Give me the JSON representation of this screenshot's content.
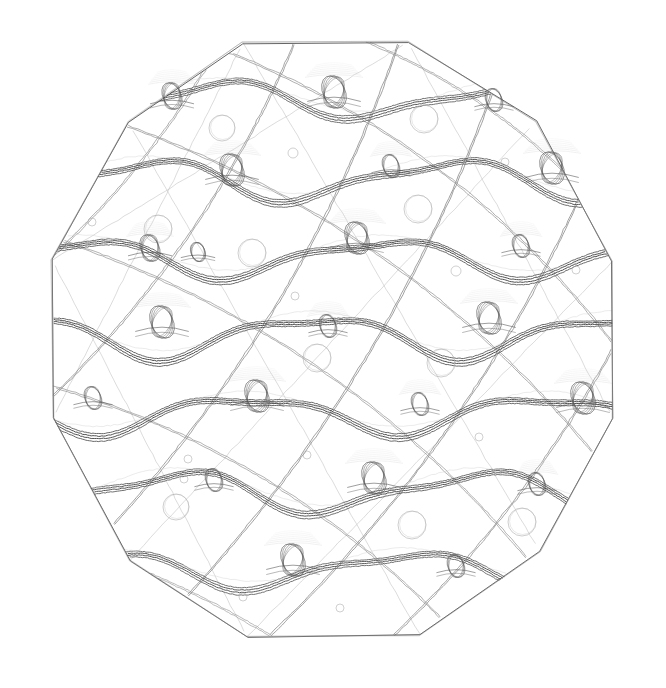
{
  "canvas": {
    "width": 666,
    "height": 688,
    "background_color": "#ffffff",
    "title": "Generative line-art plate: polygonal disc with sinusoidal bands, diagonal sweeps, loop knots and small circles"
  },
  "palette": {
    "ink_dark": "#4a4a4a",
    "ink_mid": "#6b6b6b",
    "ink_light": "#9a9a9a",
    "ink_faint": "#bdbdbd",
    "ink_ghost": "#d4d4d4",
    "background": "#ffffff"
  },
  "stroke": {
    "hairline": 0.6,
    "thin": 0.75,
    "normal": 0.9,
    "band": 1.0
  },
  "boundary": {
    "name": "polygonal-disc-outline",
    "sides": 14,
    "center_x": 333,
    "center_y": 340,
    "radius_x": 292,
    "radius_y": 300,
    "rotation_deg": 12.857,
    "vertices": [
      [
        243,
        43
      ],
      [
        408,
        42
      ],
      [
        536,
        121
      ],
      [
        612,
        262
      ],
      [
        613,
        418
      ],
      [
        540,
        552
      ],
      [
        420,
        635
      ],
      [
        247,
        637
      ],
      [
        130,
        560
      ],
      [
        53,
        418
      ],
      [
        52,
        260
      ],
      [
        128,
        122
      ]
    ],
    "note": "Near-regular many-sided polygon approximating a circle; vertical left and right edges"
  },
  "bands": {
    "name": "sinusoidal-wave-bands",
    "count": 7,
    "strokes_per_band": 4,
    "stroke_offsets": [
      -3.2,
      -1.1,
      1.1,
      3.4
    ],
    "wavelength": 300,
    "list": [
      {
        "index": 0,
        "center_y": 100,
        "amplitude": 16,
        "phase_deg": 10,
        "color": "#5a5a5a"
      },
      {
        "index": 1,
        "center_y": 180,
        "amplitude": 18,
        "phase_deg": 95,
        "color": "#555555"
      },
      {
        "index": 2,
        "center_y": 258,
        "amplitude": 17,
        "phase_deg": 175,
        "color": "#505050"
      },
      {
        "index": 3,
        "center_y": 336,
        "amplitude": 19,
        "phase_deg": 255,
        "color": "#4d4d4d"
      },
      {
        "index": 4,
        "center_y": 414,
        "amplitude": 17,
        "phase_deg": 335,
        "color": "#505050"
      },
      {
        "index": 5,
        "center_y": 492,
        "amplitude": 18,
        "phase_deg": 60,
        "color": "#555555"
      },
      {
        "index": 6,
        "center_y": 570,
        "amplitude": 16,
        "phase_deg": 145,
        "color": "#5a5a5a"
      }
    ]
  },
  "diagonals": {
    "name": "diagonal-sweep-curves",
    "count": 14,
    "direction": "lower-left to upper-right and crossing",
    "curvature": 0.22,
    "color": "#7a7a7a",
    "list": [
      {
        "x1": -30,
        "y1": 470,
        "x2": 300,
        "y2": 30,
        "bow": 70,
        "color": "#7c7c7c"
      },
      {
        "x1": 40,
        "y1": 600,
        "x2": 400,
        "y2": 40,
        "bow": 80,
        "color": "#767676"
      },
      {
        "x1": 120,
        "y1": 665,
        "x2": 500,
        "y2": 70,
        "bow": 85,
        "color": "#727272"
      },
      {
        "x1": 210,
        "y1": 690,
        "x2": 600,
        "y2": 150,
        "bow": 80,
        "color": "#767676"
      },
      {
        "x1": 320,
        "y1": 700,
        "x2": 660,
        "y2": 250,
        "bow": 70,
        "color": "#7c7c7c"
      },
      {
        "x1": 430,
        "y1": 700,
        "x2": 690,
        "y2": 360,
        "bow": 55,
        "color": "#858585"
      },
      {
        "x1": -40,
        "y1": 330,
        "x2": 230,
        "y2": 25,
        "bow": 50,
        "color": "#888888"
      },
      {
        "x1": 60,
        "y1": 240,
        "x2": 560,
        "y2": 600,
        "bow": -95,
        "color": "#8e8e8e"
      },
      {
        "x1": 30,
        "y1": 380,
        "x2": 480,
        "y2": 660,
        "bow": -80,
        "color": "#8e8e8e"
      },
      {
        "x1": 110,
        "y1": 120,
        "x2": 630,
        "y2": 500,
        "bow": -100,
        "color": "#8a8a8a"
      },
      {
        "x1": 210,
        "y1": 45,
        "x2": 650,
        "y2": 395,
        "bow": -90,
        "color": "#8a8a8a"
      },
      {
        "x1": 350,
        "y1": 35,
        "x2": 665,
        "y2": 300,
        "bow": -70,
        "color": "#909090"
      },
      {
        "x1": -20,
        "y1": 520,
        "x2": 350,
        "y2": 690,
        "bow": -45,
        "color": "#9a9a9a"
      },
      {
        "x1": 470,
        "y1": 55,
        "x2": 680,
        "y2": 210,
        "bow": -40,
        "color": "#9a9a9a"
      }
    ]
  },
  "knots": {
    "name": "loop-knot-ornaments",
    "count": 26,
    "description": "Small vertically-elongated interlaced loops sitting on wave band crests with fine whisker arcs",
    "list": [
      {
        "cx": 172,
        "cy": 96,
        "rx": 9,
        "ry": 14,
        "size": "medium",
        "whiskers": true
      },
      {
        "cx": 334,
        "cy": 92,
        "rx": 11,
        "ry": 17,
        "size": "large",
        "whiskers": true
      },
      {
        "cx": 494,
        "cy": 100,
        "rx": 8,
        "ry": 12,
        "size": "small",
        "whiskers": false
      },
      {
        "cx": 232,
        "cy": 170,
        "rx": 11,
        "ry": 17,
        "size": "large",
        "whiskers": true
      },
      {
        "cx": 391,
        "cy": 166,
        "rx": 8,
        "ry": 12,
        "size": "small",
        "whiskers": true
      },
      {
        "cx": 552,
        "cy": 168,
        "rx": 11,
        "ry": 17,
        "size": "large",
        "whiskers": true
      },
      {
        "cx": 150,
        "cy": 248,
        "rx": 9,
        "ry": 14,
        "size": "medium",
        "whiskers": true
      },
      {
        "cx": 198,
        "cy": 252,
        "rx": 7,
        "ry": 10,
        "size": "small",
        "whiskers": false
      },
      {
        "cx": 357,
        "cy": 238,
        "rx": 11,
        "ry": 17,
        "size": "large",
        "whiskers": true
      },
      {
        "cx": 521,
        "cy": 246,
        "rx": 8,
        "ry": 12,
        "size": "small",
        "whiskers": true
      },
      {
        "cx": 162,
        "cy": 322,
        "rx": 11,
        "ry": 17,
        "size": "large",
        "whiskers": true
      },
      {
        "cx": 328,
        "cy": 326,
        "rx": 8,
        "ry": 12,
        "size": "small",
        "whiskers": true
      },
      {
        "cx": 489,
        "cy": 318,
        "rx": 11,
        "ry": 17,
        "size": "large",
        "whiskers": true
      },
      {
        "cx": 93,
        "cy": 398,
        "rx": 8,
        "ry": 12,
        "size": "small",
        "whiskers": false
      },
      {
        "cx": 257,
        "cy": 396,
        "rx": 11,
        "ry": 17,
        "size": "large",
        "whiskers": true
      },
      {
        "cx": 420,
        "cy": 404,
        "rx": 8,
        "ry": 12,
        "size": "small",
        "whiskers": true
      },
      {
        "cx": 583,
        "cy": 398,
        "rx": 11,
        "ry": 17,
        "size": "large",
        "whiskers": true
      },
      {
        "cx": 214,
        "cy": 480,
        "rx": 8,
        "ry": 12,
        "size": "small",
        "whiskers": false
      },
      {
        "cx": 374,
        "cy": 478,
        "rx": 11,
        "ry": 17,
        "size": "large",
        "whiskers": true
      },
      {
        "cx": 537,
        "cy": 484,
        "rx": 8,
        "ry": 12,
        "size": "small",
        "whiskers": true
      },
      {
        "cx": 293,
        "cy": 560,
        "rx": 11,
        "ry": 17,
        "size": "large",
        "whiskers": true
      },
      {
        "cx": 456,
        "cy": 566,
        "rx": 8,
        "ry": 12,
        "size": "small",
        "whiskers": false
      },
      {
        "cx": 617,
        "cy": 560,
        "rx": 8,
        "ry": 12,
        "size": "small",
        "whiskers": false
      },
      {
        "cx": 59,
        "cy": 172,
        "rx": 7,
        "ry": 10,
        "size": "small",
        "whiskers": false
      },
      {
        "cx": 607,
        "cy": 246,
        "rx": 7,
        "ry": 10,
        "size": "small",
        "whiskers": false
      },
      {
        "cx": 131,
        "cy": 562,
        "rx": 7,
        "ry": 10,
        "size": "small",
        "whiskers": false
      }
    ]
  },
  "circles": {
    "name": "small-open-circles",
    "count": 22,
    "description": "Small open circles riding along the diagonal sweep curves",
    "color": "#a8a8a8",
    "list": [
      {
        "cx": 222,
        "cy": 128,
        "r": 13
      },
      {
        "cx": 424,
        "cy": 119,
        "r": 14
      },
      {
        "cx": 293,
        "cy": 153,
        "r": 5
      },
      {
        "cx": 505,
        "cy": 162,
        "r": 4
      },
      {
        "cx": 418,
        "cy": 209,
        "r": 14
      },
      {
        "cx": 158,
        "cy": 229,
        "r": 14
      },
      {
        "cx": 252,
        "cy": 253,
        "r": 14
      },
      {
        "cx": 92,
        "cy": 222,
        "r": 4
      },
      {
        "cx": 295,
        "cy": 296,
        "r": 4
      },
      {
        "cx": 456,
        "cy": 271,
        "r": 5
      },
      {
        "cx": 576,
        "cy": 270,
        "r": 4
      },
      {
        "cx": 317,
        "cy": 358,
        "r": 14
      },
      {
        "cx": 441,
        "cy": 363,
        "r": 14
      },
      {
        "cx": 188,
        "cy": 459,
        "r": 4
      },
      {
        "cx": 307,
        "cy": 455,
        "r": 4
      },
      {
        "cx": 522,
        "cy": 522,
        "r": 14
      },
      {
        "cx": 412,
        "cy": 525,
        "r": 14
      },
      {
        "cx": 184,
        "cy": 479,
        "r": 4
      },
      {
        "cx": 243,
        "cy": 597,
        "r": 4
      },
      {
        "cx": 340,
        "cy": 608,
        "r": 4
      },
      {
        "cx": 176,
        "cy": 507,
        "r": 13
      },
      {
        "cx": 479,
        "cy": 437,
        "r": 4
      }
    ]
  },
  "chords": {
    "name": "inner-polygon-chords",
    "description": "Faint straight chords running across the polygon interior",
    "color": "#b0b0b0",
    "list": [
      {
        "x1": 53,
        "y1": 260,
        "x2": 408,
        "y2": 42
      },
      {
        "x1": 53,
        "y1": 418,
        "x2": 243,
        "y2": 43
      },
      {
        "x1": 128,
        "y1": 122,
        "x2": 420,
        "y2": 635
      },
      {
        "x1": 243,
        "y1": 43,
        "x2": 540,
        "y2": 552
      },
      {
        "x1": 130,
        "y1": 560,
        "x2": 536,
        "y2": 121
      },
      {
        "x1": 247,
        "y1": 637,
        "x2": 612,
        "y2": 262
      },
      {
        "x1": 408,
        "y1": 42,
        "x2": 613,
        "y2": 418
      },
      {
        "x1": 52,
        "y1": 260,
        "x2": 247,
        "y2": 637
      }
    ]
  }
}
